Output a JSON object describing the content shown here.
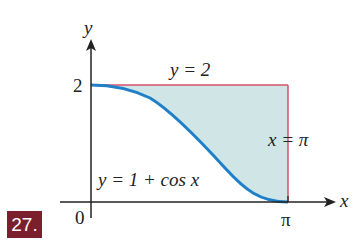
{
  "problem_number": "27.",
  "axes": {
    "x_label": "x",
    "y_label": "y",
    "origin_label": "0",
    "y_tick_label": "2",
    "x_tick_label": "π"
  },
  "curves": {
    "top_line_label": "y = 2",
    "right_line_label": "x = π",
    "curve_label": "y = 1 + cos x"
  },
  "colors": {
    "fill": "#cfe5e6",
    "curve": "#1f7fc8",
    "lines": "#d4506a",
    "badge": "#7a1f2b"
  }
}
